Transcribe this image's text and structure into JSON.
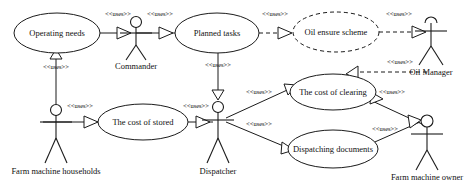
{
  "diagram": {
    "kind": "uml-use-case-diagram",
    "stereotype_label": "<<uses>>",
    "use_cases": [
      {
        "id": "operating_needs",
        "label": "Operating needs",
        "cx": 57,
        "cy": 33,
        "rx": 43,
        "ry": 20,
        "style": "solid"
      },
      {
        "id": "planned_tasks",
        "label": "Planned tasks",
        "cx": 217,
        "cy": 33,
        "rx": 42,
        "ry": 20,
        "style": "solid"
      },
      {
        "id": "oil_ensure_scheme",
        "label": "Oil ensure scheme",
        "cx": 336,
        "cy": 32,
        "rx": 43,
        "ry": 20,
        "style": "dashed"
      },
      {
        "id": "the_cost_of_stored",
        "label": "The cost of stored",
        "cx": 143,
        "cy": 122,
        "rx": 45,
        "ry": 18,
        "style": "solid"
      },
      {
        "id": "the_cost_of_clearing",
        "label": "The cost of clearing",
        "cx": 333,
        "cy": 92,
        "rx": 43,
        "ry": 18,
        "style": "solid"
      },
      {
        "id": "dispatching_documents",
        "label": "Dispatching documents",
        "cx": 333,
        "cy": 149,
        "rx": 45,
        "ry": 19,
        "style": "solid"
      }
    ],
    "actors": [
      {
        "id": "commander",
        "label": "Commander",
        "x": 136,
        "y": 16,
        "name_y": 64
      },
      {
        "id": "oil_manager",
        "label": "Oil Manager",
        "x": 431,
        "y": 14,
        "name_y": 73
      },
      {
        "id": "farm_machine_households",
        "label": "Farm machine households",
        "x": 56,
        "y": 104,
        "name_y": 172
      },
      {
        "id": "dispatcher",
        "label": "Dispatcher",
        "x": 218,
        "y": 101,
        "name_y": 172
      },
      {
        "id": "farm_machine_owner",
        "label": "Farm machine owner",
        "x": 427,
        "y": 115,
        "name_y": 178
      }
    ],
    "relationships": [
      {
        "id": "rel-operating-needs-commander",
        "from": "operating_needs",
        "to": "commander",
        "label": "<<uses>>",
        "label_x": 118,
        "label_y": 14,
        "style": "solid"
      },
      {
        "id": "rel-commander-planned-tasks",
        "from": "commander",
        "to": "planned_tasks",
        "label": "<<uses>>",
        "label_x": 160,
        "label_y": 14,
        "style": "solid"
      },
      {
        "id": "rel-planned-tasks-oil-ensure",
        "from": "planned_tasks",
        "to": "oil_ensure_scheme",
        "label": "<<uses>>",
        "label_x": 275,
        "label_y": 14,
        "style": "dashed"
      },
      {
        "id": "rel-oil-ensure-oil-manager",
        "from": "oil_ensure_scheme",
        "to": "oil_manager",
        "label": "<<uses>>",
        "label_x": 399,
        "label_y": 14,
        "style": "dashed"
      },
      {
        "id": "rel-households-operating-needs",
        "from": "farm_machine_households",
        "to": "operating_needs",
        "label": "<<uses>>",
        "label_x": 56,
        "label_y": 68,
        "style": "solid"
      },
      {
        "id": "rel-planned-tasks-dispatcher",
        "from": "planned_tasks",
        "to": "dispatcher",
        "label": "<<uses>>",
        "label_x": 218,
        "label_y": 66,
        "style": "solid"
      },
      {
        "id": "rel-households-cost-of-stored",
        "from": "farm_machine_households",
        "to": "the_cost_of_stored",
        "label": "<<uses>>",
        "label_x": 80,
        "label_y": 106,
        "style": "solid"
      },
      {
        "id": "rel-cost-of-stored-dispatcher",
        "from": "the_cost_of_stored",
        "to": "dispatcher",
        "label": "<<uses>>",
        "label_x": 196,
        "label_y": 106,
        "style": "solid"
      },
      {
        "id": "rel-dispatcher-cost-of-clearing",
        "from": "dispatcher",
        "to": "the_cost_of_clearing",
        "label": "<<uses>>",
        "label_x": 258,
        "label_y": 93,
        "style": "solid"
      },
      {
        "id": "rel-dispatcher-dispatching-documents",
        "from": "dispatcher",
        "to": "dispatching_documents",
        "label": "<<uses>>",
        "label_x": 258,
        "label_y": 124,
        "style": "solid"
      },
      {
        "id": "rel-cost-of-clearing-oil-manager",
        "from": "the_cost_of_clearing",
        "to": "oil_manager",
        "label": "<<uses>>",
        "label_x": 400,
        "label_y": 74,
        "style": "dashed"
      },
      {
        "id": "rel-cost-of-clearing-owner",
        "from": "the_cost_of_clearing",
        "to": "farm_machine_owner",
        "label": "<<uses>>",
        "label_x": 388,
        "label_y": 96,
        "style": "solid"
      },
      {
        "id": "rel-dispatching-documents-owner",
        "from": "dispatching_documents",
        "to": "farm_machine_owner",
        "label": "<<uses>>",
        "label_x": 385,
        "label_y": 131,
        "style": "solid"
      }
    ],
    "colors": {
      "stroke": "#1b1b1b",
      "fill": "#ffffff",
      "text": "#111111",
      "background": "#ffffff"
    }
  }
}
